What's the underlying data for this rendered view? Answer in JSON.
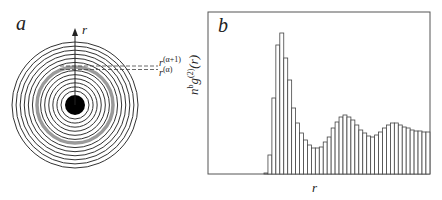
{
  "panel_a": {
    "label": "a",
    "axis_label": "r",
    "shell_labels": {
      "upper": "r(α+1)",
      "lower": "r(α)"
    },
    "upper_base": "r",
    "upper_sup": "(α+1)",
    "lower_base": "r",
    "lower_sup": "(α)",
    "center": [
      75,
      105
    ],
    "outer_radius": 63,
    "inner_disc_radius": 10,
    "ring_count": 13,
    "highlight_ring_color": "#9a9a9a"
  },
  "panel_b": {
    "label": "b",
    "xlabel": "r",
    "ylabel_base": "n",
    "ylabel_sup1": "b",
    "ylabel_mid": "g",
    "ylabel_sup2": "(2)",
    "ylabel_end": "(r)"
  },
  "chart_data": {
    "type": "bar",
    "title": "",
    "xlabel": "r",
    "ylabel": "n^b g^(2)(r)",
    "grid": false,
    "note": "Histogram of radial distribution function; values are bar heights in plot pixels (baseline=0, frame height≈162)",
    "values": [
      1,
      19,
      76,
      129,
      141,
      116,
      94,
      66,
      51,
      41,
      34,
      29,
      26,
      26,
      27,
      32,
      37,
      46,
      52,
      57,
      59,
      57,
      54,
      49,
      44,
      41,
      38,
      37,
      39,
      42,
      46,
      49,
      51,
      51,
      49,
      47,
      46,
      44,
      43,
      43,
      42,
      42
    ]
  }
}
